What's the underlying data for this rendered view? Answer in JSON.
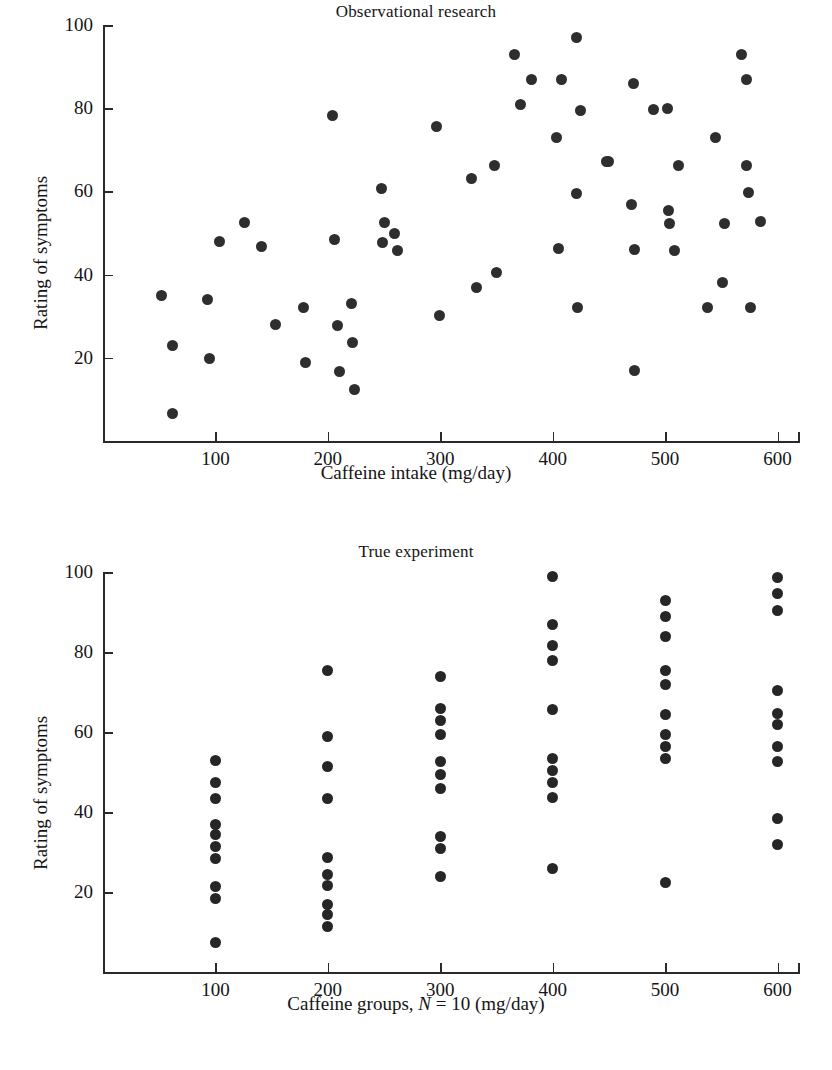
{
  "page": {
    "width": 832,
    "height": 1070,
    "background": "#ffffff",
    "marker_color": "#2e2e2e",
    "axis_color": "#2a2a2a"
  },
  "figures": [
    {
      "id": "observational",
      "title": "Observational research",
      "xlabel": "Caffeine intake (mg/day)",
      "ylabel": "Rating of symptoms"
    },
    {
      "id": "experiment",
      "title": "True experiment",
      "xlabel_parts": {
        "before": "Caffeine groups, ",
        "italic": "N",
        "after": " = 10 (mg/day)"
      },
      "xlabel": "Caffeine groups, N = 10 (mg/day)",
      "ylabel": "Rating of symptoms"
    }
  ],
  "chart_data": [
    {
      "type": "scatter",
      "title": "Observational research",
      "xlabel": "Caffeine intake (mg/day)",
      "ylabel": "Rating of symptoms",
      "xlim": [
        0,
        620
      ],
      "ylim": [
        0,
        100
      ],
      "xticks": [
        100,
        200,
        300,
        400,
        500,
        600
      ],
      "yticks": [
        20,
        40,
        60,
        80,
        100
      ],
      "grid": false,
      "legend": null,
      "n_points": 62,
      "points": [
        [
          52,
          35
        ],
        [
          62,
          23
        ],
        [
          62,
          6.5
        ],
        [
          93,
          34
        ],
        [
          95,
          19.8
        ],
        [
          104,
          48
        ],
        [
          126,
          52.5
        ],
        [
          141,
          46.8
        ],
        [
          153,
          28
        ],
        [
          178,
          32
        ],
        [
          180,
          18.8
        ],
        [
          204,
          78.3
        ],
        [
          206,
          48.5
        ],
        [
          209,
          27.8
        ],
        [
          210,
          16.8
        ],
        [
          221,
          33
        ],
        [
          222,
          23.6
        ],
        [
          224,
          12.3
        ],
        [
          248,
          60.7
        ],
        [
          250,
          52.5
        ],
        [
          249,
          47.6
        ],
        [
          259,
          50
        ],
        [
          262,
          45.8
        ],
        [
          297,
          75.5
        ],
        [
          299,
          30.2
        ],
        [
          328,
          63
        ],
        [
          332,
          37
        ],
        [
          348,
          66.3
        ],
        [
          350,
          40.4
        ],
        [
          366,
          93
        ],
        [
          371,
          81
        ],
        [
          381,
          87
        ],
        [
          403,
          73
        ],
        [
          405,
          46.3
        ],
        [
          408,
          87
        ],
        [
          421,
          97
        ],
        [
          421,
          59.6
        ],
        [
          422,
          32
        ],
        [
          425,
          79.5
        ],
        [
          448,
          67.2
        ],
        [
          472,
          86
        ],
        [
          473,
          46
        ],
        [
          473,
          17
        ],
        [
          470,
          56.8
        ],
        [
          490,
          79.8
        ],
        [
          502,
          80
        ],
        [
          503,
          55.3
        ],
        [
          504,
          52.2
        ],
        [
          508,
          45.8
        ],
        [
          512,
          66.3
        ],
        [
          538,
          32
        ],
        [
          545,
          73
        ],
        [
          551,
          38
        ],
        [
          553,
          52.3
        ],
        [
          568,
          93
        ],
        [
          572,
          87
        ],
        [
          572,
          66.3
        ],
        [
          574,
          59.8
        ],
        [
          576,
          32
        ],
        [
          585,
          52.8
        ],
        [
          450,
          67.2
        ],
        [
          470,
          56.8
        ]
      ]
    },
    {
      "type": "scatter",
      "title": "True experiment",
      "xlabel": "Caffeine groups, N = 10 (mg/day)",
      "ylabel": "Rating of symptoms",
      "xlim": [
        0,
        620
      ],
      "ylim": [
        0,
        100
      ],
      "xticks": [
        100,
        200,
        300,
        400,
        500,
        600
      ],
      "yticks": [
        20,
        40,
        60,
        80,
        100
      ],
      "grid": false,
      "legend": null,
      "group_size": 10,
      "groups": [
        {
          "x": 100,
          "values": [
            53,
            47.5,
            43.5,
            37,
            34.5,
            31.5,
            28.5,
            21.5,
            18.5,
            7.5
          ]
        },
        {
          "x": 200,
          "values": [
            75.5,
            59,
            51.3,
            43.5,
            28.7,
            24.5,
            21.7,
            17,
            14.3,
            11.3
          ]
        },
        {
          "x": 300,
          "values": [
            74,
            66,
            63,
            59.3,
            52.7,
            49.5,
            46,
            34,
            31,
            23.8
          ]
        },
        {
          "x": 400,
          "values": [
            99,
            86.8,
            81.7,
            78,
            65.7,
            53.5,
            50.3,
            47.5,
            43.7,
            26
          ]
        },
        {
          "x": 500,
          "values": [
            93,
            89,
            84,
            75.3,
            72,
            64.3,
            59.5,
            56.5,
            53.3,
            22.3
          ]
        },
        {
          "x": 600,
          "values": [
            98.7,
            94.7,
            90.5,
            70.5,
            64.7,
            62,
            56.5,
            52.7,
            38.3,
            32
          ]
        }
      ]
    }
  ]
}
